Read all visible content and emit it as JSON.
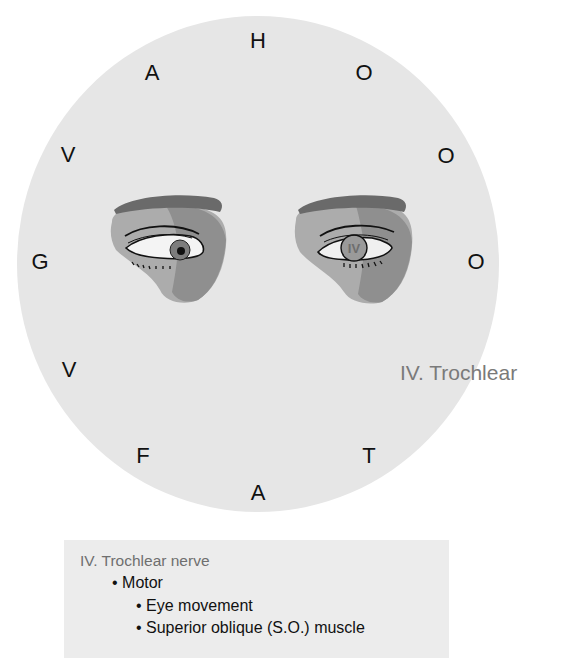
{
  "diagram": {
    "mnemonic_letters": [
      {
        "char": "H",
        "x": 258,
        "y": 41
      },
      {
        "char": "O",
        "x": 364,
        "y": 73
      },
      {
        "char": "O",
        "x": 446,
        "y": 156
      },
      {
        "char": "O",
        "x": 476,
        "y": 262
      },
      {
        "char": "T",
        "x": 369,
        "y": 456
      },
      {
        "char": "A",
        "x": 258,
        "y": 493
      },
      {
        "char": "F",
        "x": 143,
        "y": 456
      },
      {
        "char": "V",
        "x": 69,
        "y": 370
      },
      {
        "char": "G",
        "x": 40,
        "y": 262
      },
      {
        "char": "V",
        "x": 68,
        "y": 155
      },
      {
        "char": "A",
        "x": 152,
        "y": 73
      }
    ],
    "side_label": "IV. Trochlear",
    "eye_badge": "IV",
    "colors": {
      "circle_bg": "#e6e6e6",
      "brow": "#6e6e6e",
      "lid_mid": "#a9a9a9",
      "lid_dark": "#8c8c8c",
      "iris": "#7d7d7d"
    }
  },
  "info_box": {
    "title": "IV. Trochlear nerve",
    "items": [
      "• Motor",
      "• Eye movement",
      "• Superior oblique (S.O.) muscle"
    ]
  }
}
